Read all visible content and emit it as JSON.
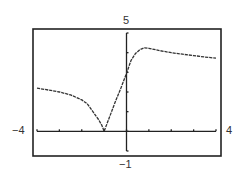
{
  "chart_data": {
    "type": "line",
    "title": "",
    "xlabel": "",
    "ylabel": "",
    "xlim": [
      -4,
      4
    ],
    "ylim": [
      -1,
      5
    ],
    "x_tick_step": 1,
    "y_tick_step": 1,
    "grid": false,
    "legend": null,
    "window_labels": {
      "xmin": "−4",
      "xmax": "4",
      "ymin": "−1",
      "ymax": "5"
    },
    "series": [
      {
        "name": "f(x)",
        "x": [
          -4,
          -3.5,
          -3,
          -2.5,
          -2,
          -1.75,
          -1.5,
          -1.25,
          -1.1,
          -1,
          -0.75,
          -0.5,
          -0.25,
          0,
          0.2,
          0.4,
          0.6,
          0.8,
          1.0,
          1.5,
          2,
          2.5,
          3,
          3.5,
          4
        ],
        "y": [
          2.2,
          2.1,
          2.0,
          1.85,
          1.6,
          1.4,
          1.0,
          0.6,
          0.3,
          0.0,
          0.75,
          1.5,
          2.2,
          2.95,
          3.6,
          3.95,
          4.15,
          4.25,
          4.22,
          4.1,
          4.0,
          3.92,
          3.85,
          3.78,
          3.72
        ]
      }
    ]
  }
}
